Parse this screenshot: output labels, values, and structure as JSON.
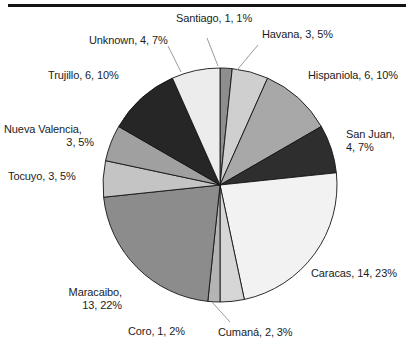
{
  "chart_data": {
    "type": "pie",
    "title": "",
    "subtitle": "",
    "xlabel": "",
    "ylabel": "",
    "legend_position": "none",
    "grid": false,
    "total": 60,
    "label_format": "name, count, percent",
    "start_angle_deg": 0,
    "direction": "clockwise",
    "categories": [
      "Santiago",
      "Havana",
      "Hispaniola",
      "San Juan",
      "Caracas",
      "Cumaná",
      "Coro",
      "Maracaibo",
      "Tocuyo",
      "Nueva Valencia",
      "Trujillo",
      "Unknown"
    ],
    "values": [
      1,
      3,
      6,
      4,
      14,
      2,
      1,
      13,
      3,
      3,
      6,
      4
    ],
    "percents": [
      1,
      5,
      10,
      7,
      23,
      3,
      2,
      22,
      5,
      5,
      10,
      7
    ],
    "colors": [
      "#8e8e8e",
      "#cfcfcf",
      "#a8a8a8",
      "#2e2e2e",
      "#f2f2f2",
      "#d6d6d6",
      "#b4b4b4",
      "#8c8c8c",
      "#c4c4c4",
      "#a0a0a0",
      "#262626",
      "#ececec"
    ],
    "slices": [
      {
        "name": "Santiago",
        "value": 1,
        "percent": 1,
        "label": "Santiago, 1, 1%",
        "color": "#8e8e8e"
      },
      {
        "name": "Havana",
        "value": 3,
        "percent": 5,
        "label": "Havana, 3, 5%",
        "color": "#cfcfcf"
      },
      {
        "name": "Hispaniola",
        "value": 6,
        "percent": 10,
        "label": "Hispaniola, 6, 10%",
        "color": "#a8a8a8"
      },
      {
        "name": "San Juan",
        "value": 4,
        "percent": 7,
        "label": "San Juan,\n4, 7%",
        "color": "#2e2e2e"
      },
      {
        "name": "Caracas",
        "value": 14,
        "percent": 23,
        "label": "Caracas, 14, 23%",
        "color": "#f2f2f2"
      },
      {
        "name": "Cumaná",
        "value": 2,
        "percent": 3,
        "label": "Cumaná, 2, 3%",
        "color": "#d6d6d6"
      },
      {
        "name": "Coro",
        "value": 1,
        "percent": 2,
        "label": "Coro, 1, 2%",
        "color": "#b4b4b4"
      },
      {
        "name": "Maracaibo",
        "value": 13,
        "percent": 22,
        "label": "Maracaibo,\n13, 22%",
        "color": "#8c8c8c"
      },
      {
        "name": "Tocuyo",
        "value": 3,
        "percent": 5,
        "label": "Tocuyo, 3, 5%",
        "color": "#c4c4c4"
      },
      {
        "name": "Nueva Valencia",
        "value": 3,
        "percent": 5,
        "label": "Nueva Valencia,\n3, 5%",
        "color": "#a0a0a0"
      },
      {
        "name": "Trujillo",
        "value": 6,
        "percent": 10,
        "label": "Trujillo, 6, 10%",
        "color": "#262626"
      },
      {
        "name": "Unknown",
        "value": 4,
        "percent": 7,
        "label": "Unknown, 4, 7%",
        "color": "#ececec"
      }
    ]
  },
  "labels": {
    "santiago": "Santiago, 1, 1%",
    "havana": "Havana, 3, 5%",
    "hispaniola": "Hispaniola, 6, 10%",
    "san_juan_line1": "San Juan,",
    "san_juan_line2": "4, 7%",
    "caracas": "Caracas, 14, 23%",
    "cumana": "Cumaná, 2, 3%",
    "coro": "Coro, 1, 2%",
    "maracaibo_line1": "Maracaibo,",
    "maracaibo_line2": "13, 22%",
    "tocuyo": "Tocuyo, 3, 5%",
    "nueva_valencia_line1": "Nueva Valencia,",
    "nueva_valencia_line2": "3, 5%",
    "trujillo": "Trujillo, 6, 10%",
    "unknown": "Unknown, 4, 7%"
  },
  "style": {
    "outline_color": "#141414",
    "background": "#ffffff",
    "leader_line_color": "#9a9a9a"
  }
}
